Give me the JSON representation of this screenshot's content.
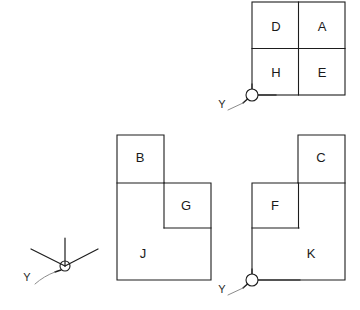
{
  "diagram": {
    "background_color": "#ffffff",
    "line_color": "#1d1d1d",
    "leader_color": "#8c8c8c",
    "views": [
      {
        "id": "top-right-square",
        "name": "four-quadrant-square",
        "faces": [
          {
            "label": "D",
            "x": 276,
            "y": 28
          },
          {
            "label": "A",
            "x": 322,
            "y": 28
          },
          {
            "label": "H",
            "x": 276,
            "y": 74
          },
          {
            "label": "E",
            "x": 322,
            "y": 74
          }
        ]
      },
      {
        "id": "middle-l-shape",
        "name": "left-l-shape",
        "faces": [
          {
            "label": "B",
            "x": 140,
            "y": 159
          },
          {
            "label": "G",
            "x": 186,
            "y": 207
          },
          {
            "label": "J",
            "x": 143,
            "y": 255
          }
        ]
      },
      {
        "id": "right-l-shape",
        "name": "right-mirrored-l-shape",
        "faces": [
          {
            "label": "C",
            "x": 321,
            "y": 159
          },
          {
            "label": "F",
            "x": 275,
            "y": 207
          },
          {
            "label": "K",
            "x": 311,
            "y": 255
          }
        ]
      }
    ],
    "datums": [
      {
        "id": "datum-top-right",
        "label": "Y",
        "label_x": 222,
        "label_y": 105,
        "circle_x": 252,
        "circle_y": 95
      },
      {
        "id": "datum-bottom-right",
        "label": "Y",
        "label_x": 222,
        "label_y": 290,
        "circle_x": 252,
        "circle_y": 280
      }
    ],
    "axis_triad": {
      "id": "axis-triad",
      "label": "Y",
      "label_x": 27,
      "label_y": 278,
      "origin_x": 65,
      "origin_y": 266
    }
  }
}
